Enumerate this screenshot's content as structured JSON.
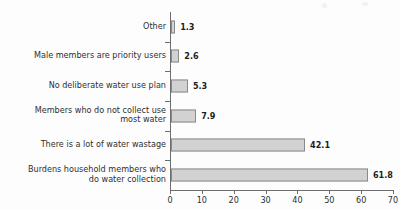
{
  "chart_data": {
    "type": "bar",
    "orientation": "horizontal",
    "title": "",
    "subtitle": "",
    "xlabel": "",
    "ylabel": "",
    "xlim": [
      0,
      70
    ],
    "xticks": [
      0,
      10,
      20,
      30,
      40,
      50,
      60,
      70
    ],
    "xtick_labels": [
      "0",
      "10",
      "20",
      "30",
      "40",
      "50",
      "60",
      "70"
    ],
    "grid": false,
    "legend": false,
    "categories": [
      "Other",
      "Male members are priority users",
      "No deliberate water use plan",
      "Members who do not collect use\nmost water",
      "There is a lot of water wastage",
      "Burdens household members who\ndo water collection"
    ],
    "values": [
      1.3,
      2.6,
      5.3,
      7.9,
      42.1,
      61.8
    ],
    "data_labels": [
      "1.3",
      "2.6",
      "5.3",
      "7.9",
      "42.1",
      "61.8"
    ],
    "colors": {
      "bar_fill": "#d2d2d2",
      "bar_border": "#8a8a8a",
      "axis": "#6d6d6d",
      "text": "#2f2f2f",
      "value_text": "#1d1d1d",
      "background": "#fdfdfd"
    }
  }
}
